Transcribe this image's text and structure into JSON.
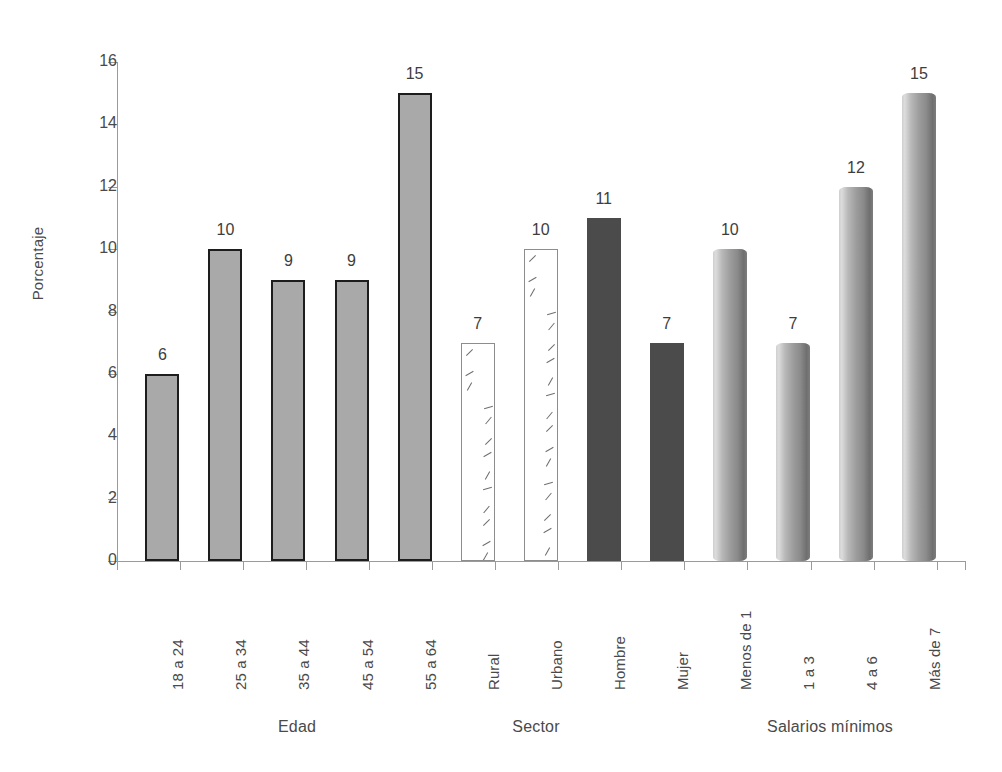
{
  "chart_data": {
    "type": "bar",
    "title": "",
    "xlabel": "",
    "ylabel": "Porcentaje",
    "ylim": [
      0,
      16
    ],
    "ytick_labels": [
      "0",
      "2",
      "4",
      "6",
      "8",
      "10",
      "12",
      "14",
      "16"
    ],
    "ytick_values": [
      0,
      2,
      4,
      6,
      8,
      10,
      12,
      14,
      16
    ],
    "grid": false,
    "legend": "none",
    "categories": [
      "18 a 24",
      "25 a 34",
      "35 a 44",
      "45 a 54",
      "55 a 64",
      "Rural",
      "Urbano",
      "Hombre",
      "Mujer",
      "Menos de 1",
      "1 a 3",
      "4 a 6",
      "Más de 7"
    ],
    "values": [
      6,
      10,
      9,
      9,
      15,
      7,
      10,
      11,
      7,
      10,
      7,
      12,
      15
    ],
    "value_labels": [
      "6",
      "10",
      "9",
      "9",
      "15",
      "7",
      "10",
      "11",
      "7",
      "10",
      "7",
      "12",
      "15"
    ],
    "bar_styles": [
      "outlined",
      "outlined",
      "outlined",
      "outlined",
      "outlined",
      "hatch",
      "hatch",
      "solid",
      "solid",
      "cylinder",
      "cylinder",
      "cylinder",
      "cylinder"
    ],
    "groups": [
      {
        "label": "Edad",
        "categories": [
          "18 a 24",
          "25 a 34",
          "35 a 44",
          "45 a 54",
          "55 a 64"
        ],
        "values": [
          6,
          10,
          9,
          9,
          15
        ]
      },
      {
        "label": "Sector",
        "categories": [
          "Rural",
          "Urbano"
        ],
        "values": [
          7,
          10
        ]
      },
      {
        "label": "Sexo",
        "categories": [
          "Hombre",
          "Mujer"
        ],
        "values": [
          11,
          7
        ]
      },
      {
        "label": "Salarios mínimos",
        "categories": [
          "Menos de 1",
          "1 a 3",
          "4 a 6",
          "Más de 7"
        ],
        "values": [
          10,
          7,
          12,
          15
        ]
      }
    ],
    "group_labels_shown": [
      "Edad",
      "Sector",
      "Salarios mínimos"
    ],
    "colors": {
      "outlined_fill": "#a9a9a9",
      "outlined_border": "#1d1d1d",
      "hatch_fill": "#ffffff",
      "hatch_border": "#8d8d8d",
      "solid_fill": "#4b4b4b",
      "cylinder_light": "#dcdcdc",
      "cylinder_dark": "#6f6f6f",
      "axis": "#9a9a9a",
      "text": "#4a4a4a",
      "background": "#ffffff"
    }
  },
  "group_labels": {
    "edad": "Edad",
    "sector": "Sector",
    "salarios": "Salarios mínimos"
  }
}
